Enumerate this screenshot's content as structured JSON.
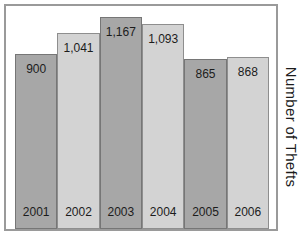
{
  "figure": {
    "background_color": "#ffffff",
    "frame_border_color": "#9a9a9a"
  },
  "chart_data": {
    "type": "bar",
    "title": "",
    "xlabel": "",
    "ylabel": "Number of Thefts",
    "categories": [
      "2001",
      "2002",
      "2003",
      "2004",
      "2005",
      "2006"
    ],
    "values": [
      900,
      1041,
      1167,
      1093,
      865,
      868
    ],
    "value_labels": [
      "900",
      "1,041",
      "1,167",
      "1,093",
      "865",
      "868"
    ],
    "bar_colors": {
      "odd_bars": "#a7a7a7",
      "even_bars": "#d3d3d3"
    },
    "layout": {
      "grid": false,
      "legend": "none",
      "axis_ticks": "none",
      "value_labels_position": "inside-top",
      "category_labels_position": "inside-bottom",
      "ylabel_position": "right-rotated-90",
      "bar_heights_px": [
        175,
        196,
        212,
        205,
        170,
        172
      ]
    }
  }
}
